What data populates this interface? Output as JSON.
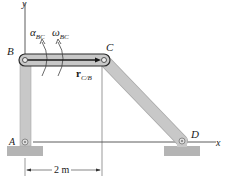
{
  "diagram": {
    "type": "four-bar linkage",
    "axes": {
      "x_label": "x",
      "y_label": "y"
    },
    "points": [
      {
        "id": "A",
        "label": "A"
      },
      {
        "id": "B",
        "label": "B"
      },
      {
        "id": "C",
        "label": "C"
      },
      {
        "id": "D",
        "label": "D"
      }
    ],
    "members": [
      "AB",
      "BC",
      "CD"
    ],
    "annotations": {
      "alpha": {
        "symbol": "α",
        "sub": "BC"
      },
      "omega": {
        "symbol": "ω",
        "sub": "BC"
      },
      "position_vector": {
        "symbol": "r",
        "sub": "C/B"
      }
    },
    "dimension": {
      "label": "2 m"
    },
    "colors": {
      "member_fill": "#c8c8c8",
      "member_edge": "#9a9a9a",
      "ground": "#b0b0b0",
      "line": "#333333",
      "bc_outline": "#2a2a2a"
    }
  }
}
